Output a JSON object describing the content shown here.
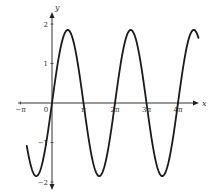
{
  "chart_data": {
    "type": "line",
    "title": "",
    "xlabel": "x",
    "ylabel": "y",
    "function": "y = A sin(x)",
    "amplitude": 1.85,
    "xlim": [
      -3.14159,
      4.65
    ],
    "xlim_units": "multiples of pi",
    "x_range_pi": [
      -0.8,
      4.65
    ],
    "ylim": [
      -2,
      2
    ],
    "x_ticks": [
      {
        "value_pi": -1,
        "label": "−π"
      },
      {
        "value_pi": 0,
        "label": "0"
      },
      {
        "value_pi": 1,
        "label": "π"
      },
      {
        "value_pi": 2,
        "label": "2π"
      },
      {
        "value_pi": 3,
        "label": "3π"
      },
      {
        "value_pi": 4,
        "label": "4π"
      }
    ],
    "y_ticks": [
      {
        "value": 2,
        "label": "2"
      },
      {
        "value": 1,
        "label": "1"
      },
      {
        "value": -1,
        "label": "−1"
      },
      {
        "value": -2,
        "label": "−2"
      }
    ],
    "series": [
      {
        "name": "curve",
        "color": "#1a1a1a",
        "sample_points": [
          {
            "x_pi": -0.8,
            "y": -1.09
          },
          {
            "x_pi": -0.5,
            "y": -1.85
          },
          {
            "x_pi": 0,
            "y": 0
          },
          {
            "x_pi": 0.5,
            "y": 1.85
          },
          {
            "x_pi": 1,
            "y": 0
          },
          {
            "x_pi": 1.5,
            "y": -1.85
          },
          {
            "x_pi": 2,
            "y": 0
          },
          {
            "x_pi": 2.5,
            "y": 1.85
          },
          {
            "x_pi": 3,
            "y": 0
          },
          {
            "x_pi": 3.5,
            "y": -1.85
          },
          {
            "x_pi": 4,
            "y": 0
          },
          {
            "x_pi": 4.5,
            "y": 1.85
          },
          {
            "x_pi": 4.65,
            "y": 1.65
          }
        ]
      }
    ],
    "grid": false,
    "legend": "none"
  },
  "layout": {
    "origin_px": [
      52,
      103
    ],
    "px_per_pi": 31.5,
    "px_per_y": 39.5,
    "x_axis_px": [
      18,
      199
    ],
    "y_axis_px": [
      12,
      190
    ]
  }
}
